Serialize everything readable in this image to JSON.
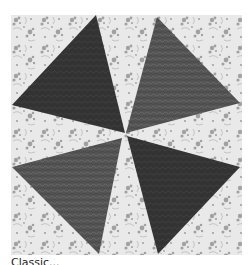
{
  "image": {
    "subject": "pinwheel quilt block",
    "description": "Four gray-print triangles radiating from the center on a light floral background",
    "background": {
      "color": "#e9e9e9",
      "pattern_color": "#8a8a8a",
      "pattern": "floral print"
    },
    "triangles": [
      {
        "position": "top-left",
        "color": "#343434",
        "points": "85,0 1,90 114,118"
      },
      {
        "position": "top-right",
        "color": "#565656",
        "points": "146,2 229,88 115,118"
      },
      {
        "position": "bottom-left",
        "color": "#585858",
        "points": "1,152 111,123 88,239"
      },
      {
        "position": "bottom-right",
        "color": "#303030",
        "points": "116,121 229,152 147,239"
      }
    ]
  },
  "caption": {
    "text": "Classic..."
  }
}
